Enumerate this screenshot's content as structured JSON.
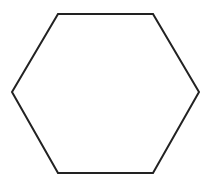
{
  "canvas": {
    "width": 211,
    "height": 184,
    "background": "#ffffff"
  },
  "shape": {
    "type": "hexagon",
    "fill": "none",
    "stroke": "#222222",
    "stroke_width": 2,
    "points": "58,14 153,14 199,92 153,173 58,173 12,92"
  }
}
